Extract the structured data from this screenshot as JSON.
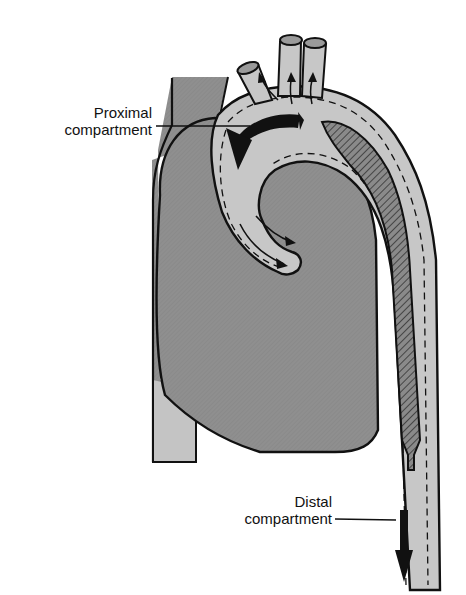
{
  "figure": {
    "colors": {
      "background": "#ffffff",
      "heart_fill": "#8c8c8c",
      "vessel_fill": "#c8c8c8",
      "outline": "#111111",
      "hatched_lumen": "#6e6e6e"
    }
  },
  "labels": {
    "proximal": {
      "line1": "Proximal",
      "line2": "compartment"
    },
    "distal": {
      "line1": "Distal",
      "line2": "compartment"
    }
  }
}
